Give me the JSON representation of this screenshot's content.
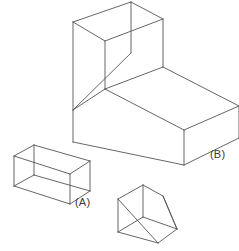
{
  "figure": {
    "background_color": "#ffffff",
    "line_color": "#555555",
    "label_color": "#3a3a3a",
    "projection": "isometric",
    "solid_count": 3,
    "solids": [
      {
        "id": "A",
        "label": "(A)",
        "name": "rectangular-box",
        "description": "Rectangular prism wireframe with hidden edges shown"
      },
      {
        "id": "B",
        "label": "(B)",
        "name": "l-shaped-block",
        "description": "L-shaped block formed by a vertical slab and a horizontal slab"
      },
      {
        "id": "C",
        "label": "",
        "name": "triangular-prism-wedge",
        "description": "Triangular prism wedge with hidden edges shown"
      }
    ],
    "labels": {
      "a": "(A)",
      "b": "(B)"
    }
  }
}
